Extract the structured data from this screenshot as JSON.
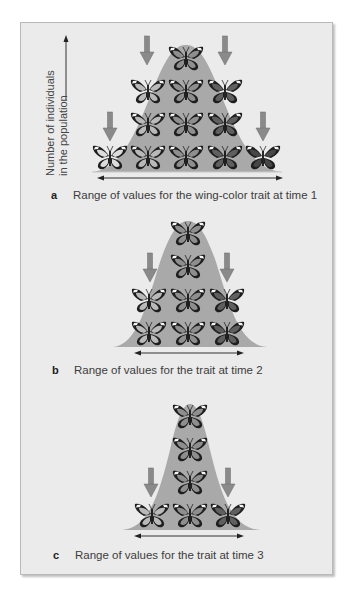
{
  "figure": {
    "y_axis_label_line1": "Number of individuals",
    "y_axis_label_line2": "in the population",
    "colors": {
      "background": "#ebebeb",
      "bell_curve": "#a9a9a9",
      "selection_arrow": "#8a8a8a",
      "range_arrow": "#333333",
      "wing_shades": [
        "#dcdcdc",
        "#b9b9b9",
        "#8e8e8e",
        "#5f5f5f",
        "#474747"
      ]
    },
    "panels": [
      {
        "letter": "a",
        "caption": "Range of values for the wing-color trait at time 1",
        "butterfly_counts_by_shade": [
          1,
          3,
          4,
          3,
          2
        ]
      },
      {
        "letter": "b",
        "caption": "Range of values for the trait at time 2",
        "butterfly_counts_by_shade": [
          0,
          2,
          4,
          2,
          0
        ]
      },
      {
        "letter": "c",
        "caption": "Range of values for the trait at time 3",
        "butterfly_counts_by_shade": [
          0,
          1,
          4,
          1,
          0
        ]
      }
    ]
  }
}
